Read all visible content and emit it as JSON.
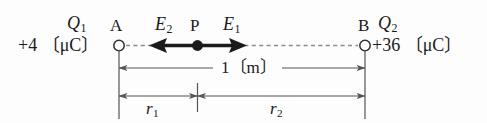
{
  "diagram": {
    "type": "physics-electric-field-diagram",
    "background_color": "#fdfdfd",
    "line_color": "#555555",
    "arrow_color": "#1a1a1a",
    "charges": [
      {
        "point_label": "A",
        "name": "Q",
        "name_subscript": "1",
        "value": "+4",
        "unit": "〔μC〕",
        "value_with_unit": "+4 〔μC〕"
      },
      {
        "point_label": "B",
        "name": "Q",
        "name_subscript": "2",
        "value": "+36",
        "unit": "〔μC〕",
        "value_with_unit": "+36 〔μC〕"
      }
    ],
    "field_point": {
      "label": "P"
    },
    "field_vectors": [
      {
        "name": "E",
        "subscript": "2",
        "direction": "left"
      },
      {
        "name": "E",
        "subscript": "1",
        "direction": "right"
      }
    ],
    "dimensions": [
      {
        "label": "1",
        "unit": "〔m〕",
        "label_with_unit": "1〔m〕",
        "span": "A-to-B"
      },
      {
        "label": "r",
        "subscript": "1",
        "span": "A-to-P"
      },
      {
        "label": "r",
        "subscript": "2",
        "span": "P-to-B"
      }
    ]
  }
}
